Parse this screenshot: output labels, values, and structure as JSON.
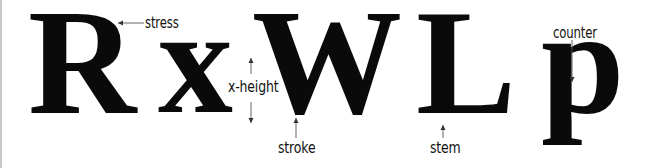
{
  "diagram": {
    "glyphs": [
      {
        "id": "R",
        "char": "R"
      },
      {
        "id": "x",
        "char": "x"
      },
      {
        "id": "W",
        "char": "W"
      },
      {
        "id": "L",
        "char": "L"
      },
      {
        "id": "p",
        "char": "p"
      }
    ],
    "labels": {
      "stress": "stress",
      "x_height": "x-height",
      "stroke": "stroke",
      "stem": "stem",
      "counter": "counter"
    },
    "colors": {
      "ink": "#0a0a0a",
      "annotation": "#111111",
      "leader_line": "#555555",
      "background": "#ffffff",
      "left_rule": "#c8c8c8"
    }
  }
}
